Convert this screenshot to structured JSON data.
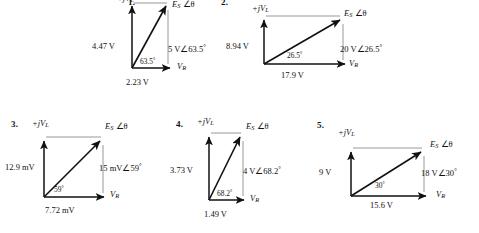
{
  "page": {
    "background_color": "#ffffff",
    "ink_color": "#111111",
    "guide_color": "#9a9a9a"
  },
  "axis_labels": {
    "imaginary_prefix": "+j",
    "imaginary_symbol": "V",
    "imaginary_subscript": "L",
    "real_symbol": "V",
    "real_subscript": "R",
    "source_symbol": "E",
    "source_subscript": "S",
    "angle_symbol": "∠θ"
  },
  "diagrams": [
    {
      "number": "1.",
      "vertical_label": "4.47 V",
      "horizontal_label": "2.23 V",
      "resultant_label": "5 V∠63.5",
      "resultant_degree": "°",
      "angle_label": "63.5",
      "angle_degree": "°",
      "imaginary_axis_label": "+jV",
      "imaginary_axis_sub": "L",
      "real_axis_label": "V",
      "real_axis_sub": "R",
      "phasor_label": "E",
      "phasor_sub": "S",
      "phasor_angle": "∠θ"
    },
    {
      "number": "2.",
      "vertical_label": "8.94 V",
      "horizontal_label": "17.9 V",
      "resultant_label": "20 V∠26.5",
      "resultant_degree": "°",
      "angle_label": "26.5",
      "angle_degree": "°",
      "imaginary_axis_label": "+jV",
      "imaginary_axis_sub": "L",
      "real_axis_label": "V",
      "real_axis_sub": "R",
      "phasor_label": "E",
      "phasor_sub": "S",
      "phasor_angle": "∠θ"
    },
    {
      "number": "3.",
      "vertical_label": "12.9 mV",
      "horizontal_label": "7.72 mV",
      "resultant_label": "15 mV∠59",
      "resultant_degree": "°",
      "angle_label": "59",
      "angle_degree": "°",
      "imaginary_axis_label": "+jV",
      "imaginary_axis_sub": "L",
      "real_axis_label": "V",
      "real_axis_sub": "R",
      "phasor_label": "E",
      "phasor_sub": "S",
      "phasor_angle": "∠θ"
    },
    {
      "number": "4.",
      "vertical_label": "3.73 V",
      "horizontal_label": "1.49 V",
      "resultant_label": "4 V∠68.2",
      "resultant_degree": "°",
      "angle_label": "68.2",
      "angle_degree": "°",
      "imaginary_axis_label": "+jV",
      "imaginary_axis_sub": "L",
      "real_axis_label": "V",
      "real_axis_sub": "R",
      "phasor_label": "E",
      "phasor_sub": "S",
      "phasor_angle": "∠θ"
    },
    {
      "number": "5.",
      "vertical_label": "9 V",
      "horizontal_label": "15.6 V",
      "resultant_label": "18 V∠30",
      "resultant_degree": "°",
      "angle_label": "30",
      "angle_degree": "°",
      "imaginary_axis_label": "+jV",
      "imaginary_axis_sub": "L",
      "real_axis_label": "V",
      "real_axis_sub": "R",
      "phasor_label": "E",
      "phasor_sub": "S",
      "phasor_angle": "∠θ"
    }
  ]
}
